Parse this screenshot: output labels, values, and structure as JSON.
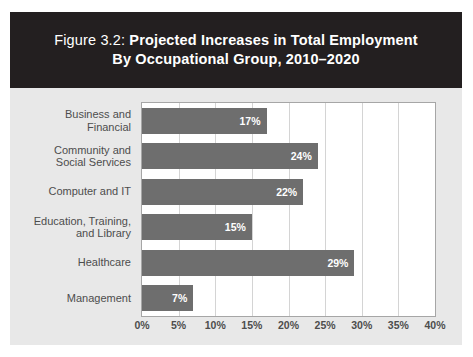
{
  "figure": {
    "title_prefix": "Figure 3.2:",
    "title_main": " Projected Increases in Total Employment",
    "title_line2": "By Occupational Group, 2010–2020",
    "title_band_color": "#231f20",
    "panel_color": "#e8e8e8",
    "bar_color": "#6e6e6e",
    "label_color": "#4d4d4d"
  },
  "chart_data": {
    "type": "bar",
    "orientation": "horizontal",
    "title": "Figure 3.2: Projected Increases in Total Employment By Occupational Group, 2010–2020",
    "xlabel": "",
    "ylabel": "",
    "xlim": [
      0,
      40
    ],
    "grid": true,
    "legend": false,
    "categories": [
      "Business and Financial",
      "Community and Social Services",
      "Computer and IT",
      "Education, Training, and Library",
      "Healthcare",
      "Management"
    ],
    "category_lines": [
      [
        "Business and",
        "Financial"
      ],
      [
        "Community and",
        "Social Services"
      ],
      [
        "Computer and IT"
      ],
      [
        "Education, Training,",
        "and Library"
      ],
      [
        "Healthcare"
      ],
      [
        "Management"
      ]
    ],
    "values": [
      17,
      24,
      22,
      15,
      29,
      7
    ],
    "data_labels": [
      "17%",
      "24%",
      "22%",
      "15%",
      "29%",
      "7%"
    ],
    "xticks": [
      0,
      5,
      10,
      15,
      20,
      25,
      30,
      35,
      40
    ],
    "xticklabels": [
      "0%",
      "5%",
      "10%",
      "15%",
      "20%",
      "25%",
      "30%",
      "35%",
      "40%"
    ]
  }
}
